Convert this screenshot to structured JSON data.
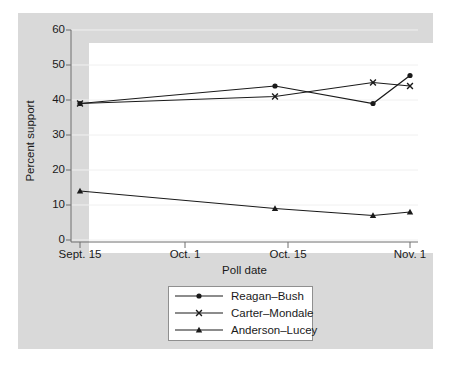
{
  "chart_data": {
    "type": "line",
    "title": "",
    "subtitle": "",
    "xlabel": "Poll date",
    "ylabel": "Percent support",
    "ylim": [
      0,
      60
    ],
    "yticks": [
      0,
      10,
      20,
      30,
      40,
      50,
      60
    ],
    "ytick_labels": [
      "0",
      "10",
      "20",
      "30",
      "40",
      "50",
      "60"
    ],
    "xtick_labels": [
      "Sept. 15",
      "Oct. 1",
      "Oct. 15",
      "Nov. 1"
    ],
    "xtick_positions_px": [
      80,
      185,
      288,
      410
    ],
    "grid": true,
    "grid_axis": "y",
    "legend_position": "below-axes",
    "x_dates": [
      "Sept. 15",
      "Oct. 12",
      "Oct. 27",
      "Nov. 1"
    ],
    "x_positions_px": [
      80,
      275,
      373,
      410
    ],
    "series": [
      {
        "name": "Reagan-Bush",
        "label": "Reagan–Bush",
        "marker": "circle",
        "color": "#1a1a1a",
        "values": [
          39,
          44,
          39,
          47
        ]
      },
      {
        "name": "Carter-Mondale",
        "label": "Carter–Mondale",
        "marker": "x",
        "color": "#1a1a1a",
        "values": [
          39,
          41,
          45,
          44
        ]
      },
      {
        "name": "Anderson-Lucey",
        "label": "Anderson–Lucey",
        "marker": "triangle",
        "color": "#1a1a1a",
        "values": [
          14,
          9,
          7,
          8
        ]
      }
    ]
  },
  "axes": {
    "y": {
      "label": "Percent support",
      "ticks": [
        "60",
        "50",
        "40",
        "30",
        "20",
        "10",
        "0"
      ]
    },
    "x": {
      "label": "Poll date",
      "ticks": [
        "Sept. 15",
        "Oct. 1",
        "Oct. 15",
        "Nov. 1"
      ]
    }
  },
  "legend": {
    "items": [
      {
        "label": "Reagan–Bush",
        "marker": "circle"
      },
      {
        "label": "Carter–Mondale",
        "marker": "x"
      },
      {
        "label": "Anderson–Lucey",
        "marker": "triangle"
      }
    ]
  },
  "colors": {
    "page_background": "#ffffff",
    "graph_region": "#d9d9d9",
    "plot_region": "#ffffff",
    "line": "#1a1a1a",
    "gridline": "#f0f0f0",
    "axis": "#6e6e6e",
    "legend_border": "#8f8f8f",
    "text": "#1a1a1a"
  }
}
